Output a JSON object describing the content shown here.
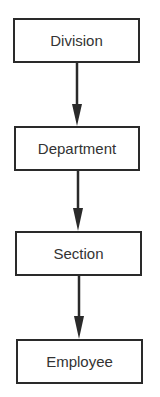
{
  "diagram": {
    "type": "hierarchy-flow",
    "nodes": [
      {
        "id": "division",
        "label": "Division"
      },
      {
        "id": "department",
        "label": "Department"
      },
      {
        "id": "section",
        "label": "Section"
      },
      {
        "id": "employee",
        "label": "Employee"
      }
    ],
    "edges": [
      {
        "from": "division",
        "to": "department"
      },
      {
        "from": "department",
        "to": "section"
      },
      {
        "from": "section",
        "to": "employee"
      }
    ],
    "colors": {
      "stroke": "#2a2a2a",
      "text": "#333333",
      "background": "#ffffff"
    }
  }
}
